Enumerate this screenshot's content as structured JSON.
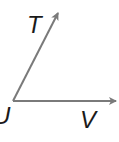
{
  "diagram": {
    "type": "angle",
    "name": "angle TUV",
    "vertex": {
      "label": "U",
      "x": 13,
      "y": 101
    },
    "rays": [
      {
        "name": "ray UT",
        "point_label": "T",
        "from": [
          13,
          101
        ],
        "to": [
          59,
          11
        ]
      },
      {
        "name": "ray UV",
        "point_label": "V",
        "from": [
          13,
          101
        ],
        "to": [
          118,
          101
        ]
      }
    ],
    "labels": {
      "t": "T",
      "u": "U",
      "v": "V"
    },
    "colors": {
      "ray": "#7a7a7a",
      "text": "#1a1a1a",
      "background": "#ffffff"
    }
  }
}
